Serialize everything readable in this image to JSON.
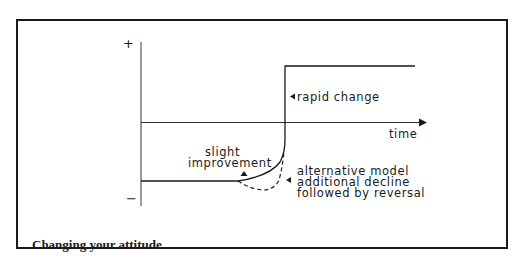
{
  "figure": {
    "caption": "Changing your attitude",
    "axes": {
      "y_plus": "+",
      "y_minus": "−",
      "x_label": "time"
    },
    "annotations": {
      "rapid_change": "rapid change",
      "slight_improvement_line1": "slight",
      "slight_improvement_line2": "improvement",
      "alternative_line1": "alternative model",
      "alternative_line2": "additional decline",
      "alternative_line3": "followed by reversal"
    },
    "colors": {
      "ink": "#1a1a1a",
      "background": "#ffffff"
    }
  }
}
